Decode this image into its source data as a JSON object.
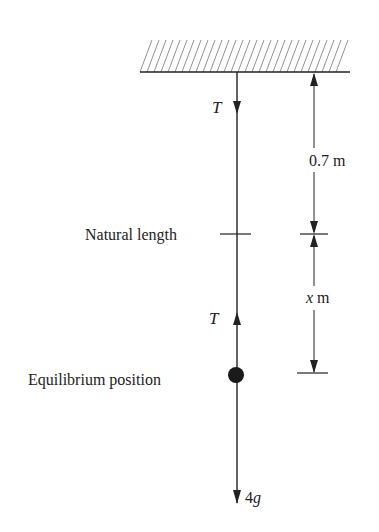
{
  "diagram": {
    "labels": {
      "tension_top": "T",
      "tension_bottom": "T",
      "natural_length": "Natural length",
      "equilibrium_position": "Equilibrium position",
      "weight_coefficient": "4",
      "weight_symbol": "g",
      "upper_length_value": "0.7",
      "upper_length_unit": "m",
      "extension_symbol": "x",
      "extension_unit": "m"
    },
    "colors": {
      "ink": "#222222",
      "hatch": "#555555",
      "background": "#ffffff"
    }
  }
}
